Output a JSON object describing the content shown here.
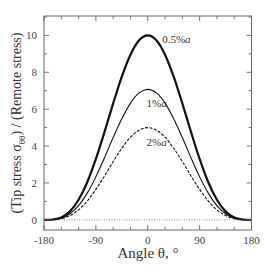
{
  "chart_data": {
    "type": "line",
    "title": "",
    "xlabel": "Angle θ, °",
    "ylabel": "(Tip stress σθθ) / (Remote stress)",
    "ylabel_parts": {
      "prefix": "(Tip stress σ",
      "subscript": "θθ",
      "suffix": ") / (Remote stress)"
    },
    "xlim": [
      -180,
      180
    ],
    "ylim": [
      -0.55,
      11.05
    ],
    "x_ticks": [
      -180,
      -90,
      0,
      90,
      180
    ],
    "x_tick_labels": [
      "-180",
      "-90",
      "0",
      "90",
      "180"
    ],
    "x_minor_step": 30,
    "y_ticks": [
      0,
      2,
      4,
      6,
      8,
      10
    ],
    "y_tick_labels": [
      "0",
      "2",
      "4",
      "6",
      "8",
      "10"
    ],
    "y_minor_step": 1,
    "grid": false,
    "legend": "inline labels",
    "x": [
      -180,
      -165,
      -150,
      -135,
      -120,
      -105,
      -90,
      -75,
      -60,
      -45,
      -30,
      -15,
      0,
      15,
      30,
      45,
      60,
      75,
      90,
      105,
      120,
      135,
      150,
      165,
      180
    ],
    "series": [
      {
        "name": "0.5%a",
        "label_main": "0.5%",
        "label_italic": "a",
        "style": "bold",
        "peak": 10.0,
        "values": [
          0,
          0.02,
          0.13,
          0.46,
          1.09,
          2.04,
          3.3,
          4.77,
          6.31,
          7.76,
          8.95,
          9.73,
          10.0,
          9.73,
          8.95,
          7.76,
          6.31,
          4.77,
          3.3,
          2.04,
          1.09,
          0.46,
          0.13,
          0.02,
          0
        ],
        "label_pos": [
          25,
          9.6
        ]
      },
      {
        "name": "1%a",
        "label_main": "1%",
        "label_italic": "a",
        "style": "solid",
        "peak": 7.07,
        "values": [
          0,
          0.01,
          0.09,
          0.33,
          0.77,
          1.45,
          2.33,
          3.37,
          4.46,
          5.48,
          6.33,
          6.88,
          7.07,
          6.88,
          6.33,
          5.48,
          4.46,
          3.37,
          2.33,
          1.45,
          0.77,
          0.33,
          0.09,
          0.01,
          0
        ],
        "label_pos": [
          -2,
          6.1
        ]
      },
      {
        "name": "2%a",
        "label_main": "2%",
        "label_italic": "a",
        "style": "dashed",
        "peak": 5.0,
        "values": [
          0,
          0.01,
          0.07,
          0.23,
          0.54,
          1.02,
          1.65,
          2.38,
          3.16,
          3.88,
          4.48,
          4.86,
          5.0,
          4.86,
          4.48,
          3.88,
          3.16,
          2.38,
          1.65,
          1.02,
          0.54,
          0.23,
          0.07,
          0.01,
          0
        ],
        "label_pos": [
          -2,
          4.0
        ]
      }
    ],
    "reference_line": {
      "y": 0,
      "style": "dotted"
    }
  }
}
